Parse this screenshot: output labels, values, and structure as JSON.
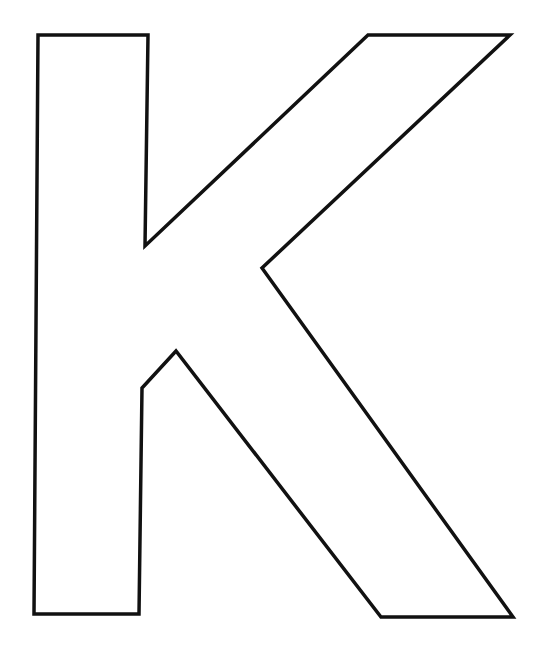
{
  "figure": {
    "letter": "K",
    "stroke_color": "#111111",
    "fill_color": "#ffffff",
    "background_color": "#ffffff",
    "stroke_width": 3.5
  }
}
